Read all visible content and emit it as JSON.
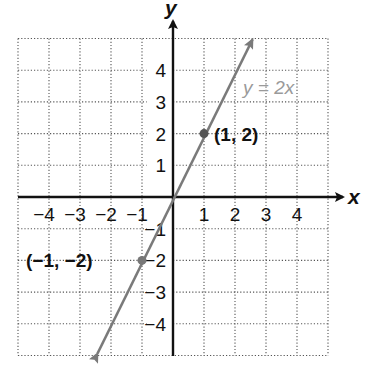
{
  "chart_data": {
    "type": "line",
    "title": "",
    "xlabel": "x",
    "ylabel": "y",
    "xlim": [
      -5,
      5
    ],
    "ylim": [
      -5,
      5
    ],
    "grid": true,
    "grid_style": "dotted",
    "x_ticks": [
      -4,
      -3,
      -2,
      -1,
      1,
      2,
      3,
      4
    ],
    "y_ticks": [
      4,
      3,
      2,
      1,
      -1,
      -2,
      -3,
      -4
    ],
    "x_tick_labels": [
      "−4",
      "−3",
      "−2",
      "−1",
      "1",
      "2",
      "3",
      "4"
    ],
    "y_tick_labels": [
      "4",
      "3",
      "2",
      "1",
      "−1",
      "−2",
      "−3",
      "−4"
    ],
    "series": [
      {
        "name": "y = 2x",
        "equation": "y = 2x",
        "x": [
          -2.5,
          2.5
        ],
        "y": [
          -5,
          5
        ],
        "color": "#7a7a7a",
        "arrows_both_ends": true
      }
    ],
    "points": [
      {
        "x": 1,
        "y": 2,
        "label": "(1, 2)"
      },
      {
        "x": -1,
        "y": -2,
        "label": "(−1, −2)"
      }
    ],
    "annotations": [
      {
        "text": "y = 2x",
        "x": 2.4,
        "y": 3.5,
        "color": "#9a9a9a"
      }
    ]
  },
  "labels": {
    "x_axis": "x",
    "y_axis": "y",
    "equation": "y = 2x",
    "point_a": "(1, 2)",
    "point_b": "(−1, −2)",
    "x_ticks": [
      "−4",
      "−3",
      "−2",
      "−1",
      "1",
      "2",
      "3",
      "4"
    ],
    "y_ticks_pos": [
      "4",
      "3",
      "2",
      "1"
    ],
    "y_ticks_neg": [
      "−1",
      "−2",
      "−3",
      "−4"
    ]
  },
  "colors": {
    "axis": "#111111",
    "grid": "#555555",
    "line": "#7a7a7a",
    "equation_label": "#9a9a9a",
    "point": "#555555"
  }
}
